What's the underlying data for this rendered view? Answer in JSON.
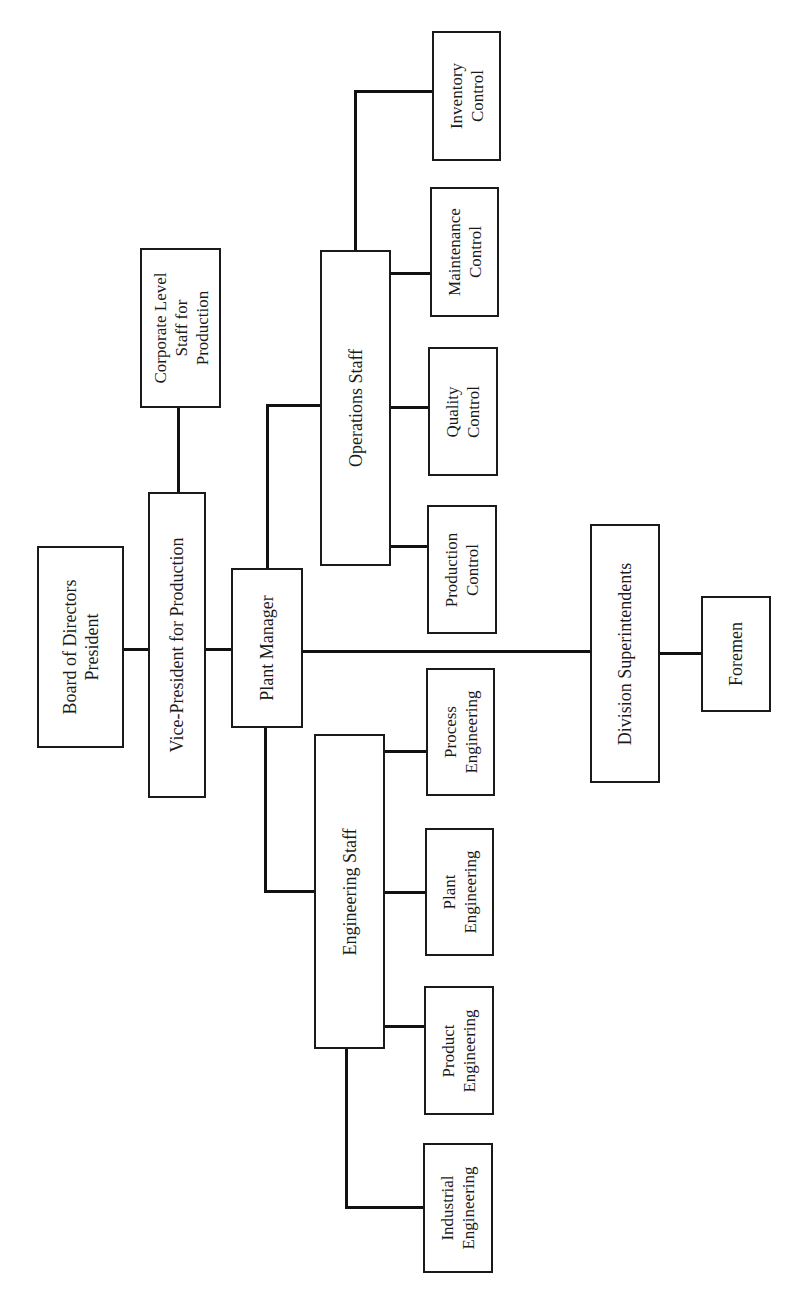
{
  "diagram": {
    "type": "organization-chart",
    "orientation": "rotated-90-ccw",
    "nodes": {
      "board": {
        "label": "Board of Directors\nPresident"
      },
      "vp": {
        "label": "Vice-President for Production"
      },
      "corporate": {
        "label": "Corporate Level\nStaff for\nProduction"
      },
      "plant_manager": {
        "label": "Plant Manager"
      },
      "operations_staff": {
        "label": "Operations Staff"
      },
      "inventory": {
        "label": "Inventory\nControl"
      },
      "maintenance": {
        "label": "Maintenance\nControl"
      },
      "quality": {
        "label": "Quality\nControl"
      },
      "production": {
        "label": "Production\nControl"
      },
      "division": {
        "label": "Division Superintendents"
      },
      "foremen": {
        "label": "Foremen"
      },
      "engineering_staff": {
        "label": "Engineering Staff"
      },
      "process_eng": {
        "label": "Process\nEngineering"
      },
      "plant_eng": {
        "label": "Plant\nEngineering"
      },
      "product_eng": {
        "label": "Product\nEngineering"
      },
      "industrial_eng": {
        "label": "Industrial\nEngineering"
      }
    },
    "edges": [
      [
        "board",
        "vp"
      ],
      [
        "vp",
        "corporate"
      ],
      [
        "vp",
        "plant_manager"
      ],
      [
        "plant_manager",
        "operations_staff"
      ],
      [
        "plant_manager",
        "engineering_staff"
      ],
      [
        "plant_manager",
        "division"
      ],
      [
        "operations_staff",
        "inventory"
      ],
      [
        "operations_staff",
        "maintenance"
      ],
      [
        "operations_staff",
        "quality"
      ],
      [
        "operations_staff",
        "production"
      ],
      [
        "division",
        "foremen"
      ],
      [
        "engineering_staff",
        "process_eng"
      ],
      [
        "engineering_staff",
        "plant_eng"
      ],
      [
        "engineering_staff",
        "product_eng"
      ],
      [
        "engineering_staff",
        "industrial_eng"
      ]
    ]
  }
}
